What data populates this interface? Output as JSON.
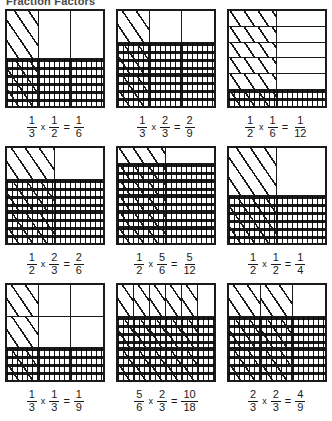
{
  "title": "Fraction Factors",
  "problems": [
    {
      "id": "problem-1",
      "cols": 3,
      "rows": 2,
      "hatched_cols": 1,
      "dotted_rows": 1,
      "factor1": {
        "num": "1",
        "den": "3"
      },
      "operator": "x",
      "factor2": {
        "num": "1",
        "den": "2"
      },
      "equals": "=",
      "product": {
        "num": "1",
        "den": "6"
      }
    },
    {
      "id": "problem-2",
      "cols": 3,
      "rows": 3,
      "hatched_cols": 1,
      "dotted_rows": 2,
      "factor1": {
        "num": "1",
        "den": "3"
      },
      "operator": "x",
      "factor2": {
        "num": "2",
        "den": "3"
      },
      "equals": "=",
      "product": {
        "num": "2",
        "den": "9"
      }
    },
    {
      "id": "problem-3",
      "cols": 2,
      "rows": 6,
      "hatched_cols": 1,
      "dotted_rows": 1,
      "factor1": {
        "num": "1",
        "den": "2"
      },
      "operator": "x",
      "factor2": {
        "num": "1",
        "den": "6"
      },
      "equals": "=",
      "product": {
        "num": "1",
        "den": "12"
      }
    },
    {
      "id": "problem-4",
      "cols": 2,
      "rows": 3,
      "hatched_cols": 1,
      "dotted_rows": 2,
      "factor1": {
        "num": "1",
        "den": "2"
      },
      "operator": "x",
      "factor2": {
        "num": "2",
        "den": "3"
      },
      "equals": "=",
      "product": {
        "num": "2",
        "den": "6"
      }
    },
    {
      "id": "problem-5",
      "cols": 2,
      "rows": 6,
      "hatched_cols": 1,
      "dotted_rows": 5,
      "factor1": {
        "num": "1",
        "den": "2"
      },
      "operator": "x",
      "factor2": {
        "num": "5",
        "den": "6"
      },
      "equals": "=",
      "product": {
        "num": "5",
        "den": "12"
      }
    },
    {
      "id": "problem-6",
      "cols": 2,
      "rows": 2,
      "hatched_cols": 1,
      "dotted_rows": 1,
      "factor1": {
        "num": "1",
        "den": "2"
      },
      "operator": "x",
      "factor2": {
        "num": "1",
        "den": "2"
      },
      "equals": "=",
      "product": {
        "num": "1",
        "den": "4"
      }
    },
    {
      "id": "problem-7",
      "cols": 3,
      "rows": 3,
      "hatched_cols": 1,
      "dotted_rows": 1,
      "factor1": {
        "num": "1",
        "den": "3"
      },
      "operator": "x",
      "factor2": {
        "num": "1",
        "den": "3"
      },
      "equals": "=",
      "product": {
        "num": "1",
        "den": "9"
      }
    },
    {
      "id": "problem-8",
      "cols": 6,
      "rows": 3,
      "hatched_cols": 5,
      "dotted_rows": 2,
      "factor1": {
        "num": "5",
        "den": "6"
      },
      "operator": "x",
      "factor2": {
        "num": "2",
        "den": "3"
      },
      "equals": "=",
      "product": {
        "num": "10",
        "den": "18"
      }
    },
    {
      "id": "problem-9",
      "cols": 3,
      "rows": 3,
      "hatched_cols": 2,
      "dotted_rows": 2,
      "factor1": {
        "num": "2",
        "den": "3"
      },
      "operator": "x",
      "factor2": {
        "num": "2",
        "den": "3"
      },
      "equals": "=",
      "product": {
        "num": "4",
        "den": "9"
      }
    }
  ],
  "colors": {
    "ink": "#1a1a1a",
    "title": "#4a4a4a",
    "paper": "#ffffff"
  }
}
